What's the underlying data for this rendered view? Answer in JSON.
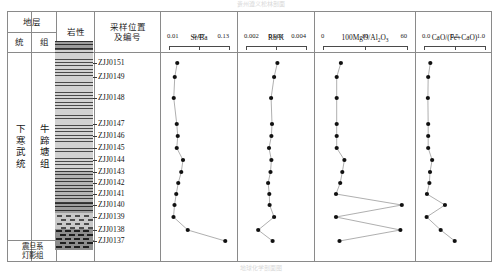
{
  "figure": {
    "top_caption_ghost": "贵州遵义松林剖面",
    "bottom_caption_ghost": "地球化学剖面图"
  },
  "table_headers": {
    "stratum": "地层",
    "stratum_sub": [
      "统",
      "组"
    ],
    "lithology": "岩性",
    "sample_position": "采样位置\n及编号",
    "sample_position_line1": "采样位置",
    "sample_position_line2": "及编号"
  },
  "stratigraphy": {
    "series_label": "下寒武统",
    "formation_label": "牛蹄塘组",
    "basal_line1": "震旦系",
    "basal_line2": "灯影组"
  },
  "samples": [
    {
      "id": "ZJJ0151",
      "y": 63
    },
    {
      "id": "ZJJ0149",
      "y": 77
    },
    {
      "id": "ZJJ0148",
      "y": 98
    },
    {
      "id": "ZJJ0147",
      "y": 124
    },
    {
      "id": "ZJJ0146",
      "y": 136
    },
    {
      "id": "ZJJ0145",
      "y": 148
    },
    {
      "id": "ZJJ0144",
      "y": 160
    },
    {
      "id": "ZJJ0143",
      "y": 172
    },
    {
      "id": "ZJJ0142",
      "y": 183
    },
    {
      "id": "ZJJ0141",
      "y": 194
    },
    {
      "id": "ZJJ0140",
      "y": 205
    },
    {
      "id": "ZJJ0139",
      "y": 217
    },
    {
      "id": "ZJJ0138",
      "y": 230
    },
    {
      "id": "ZJJ0137",
      "y": 241
    }
  ],
  "lithology_units": [
    {
      "name": "black-shale-laminated",
      "top": 0,
      "height": 8,
      "pattern": "shale-d"
    },
    {
      "name": "black-shale",
      "top": 8,
      "height": 122,
      "pattern": "shale"
    },
    {
      "name": "silty-shale",
      "top": 130,
      "height": 32,
      "pattern": "silt"
    },
    {
      "name": "dolomitic-shale",
      "top": 162,
      "height": 10,
      "pattern": "shale-d"
    },
    {
      "name": "phosphorite-dolomite",
      "top": 172,
      "height": 16,
      "pattern": "brick"
    },
    {
      "name": "dengying-dolomite",
      "top": 188,
      "height": 21,
      "pattern": "dolo"
    }
  ],
  "chart_data": [
    {
      "type": "line",
      "name": "Sr/Ba",
      "title": "Sr/Ba",
      "xlabel": "Sr/Ba",
      "ylabel": "采样位置及编号",
      "tick_labels": [
        "0.01",
        "0.07",
        "0.13"
      ],
      "tick_values": [
        0.01,
        0.07,
        0.13
      ],
      "xlim": [
        0.01,
        0.13
      ],
      "grid": false,
      "legend": "none",
      "categories": [
        "ZJJ0151",
        "ZJJ0149",
        "ZJJ0148",
        "ZJJ0147",
        "ZJJ0146",
        "ZJJ0145",
        "ZJJ0144",
        "ZJJ0143",
        "ZJJ0142",
        "ZJJ0141",
        "ZJJ0140",
        "ZJJ0139",
        "ZJJ0138",
        "ZJJ0137"
      ],
      "values": [
        0.0285,
        0.0235,
        0.0215,
        0.0275,
        0.0295,
        0.0275,
        0.04,
        0.0365,
        0.0305,
        0.0265,
        0.023,
        0.021,
        0.0495,
        0.1245
      ]
    },
    {
      "type": "line",
      "name": "Rb/K",
      "title": "Rb/K",
      "xlabel": "Rb/K",
      "ylabel": "采样位置及编号",
      "tick_labels": [
        "0.002",
        "0.003",
        "0.004"
      ],
      "tick_values": [
        0.002,
        0.003,
        0.004
      ],
      "xlim": [
        0.002,
        0.004
      ],
      "grid": false,
      "legend": "none",
      "categories": [
        "ZJJ0151",
        "ZJJ0149",
        "ZJJ0148",
        "ZJJ0147",
        "ZJJ0146",
        "ZJJ0145",
        "ZJJ0144",
        "ZJJ0143",
        "ZJJ0142",
        "ZJJ0141",
        "ZJJ0140",
        "ZJJ0139",
        "ZJJ0138",
        "ZJJ0137"
      ],
      "values": [
        0.00308,
        0.00297,
        0.00287,
        0.0029,
        0.00288,
        0.0028,
        0.00288,
        0.00285,
        0.00277,
        0.00281,
        0.00282,
        0.00297,
        0.00244,
        0.00292
      ]
    },
    {
      "type": "line",
      "name": "100MgO/Al2O3",
      "title": "100MgO/Al₂O₃",
      "xlabel": "100MgO/Al2O3",
      "ylabel": "采样位置及编号",
      "tick_labels": [
        "0",
        "30",
        "60"
      ],
      "tick_values": [
        0,
        30,
        60
      ],
      "xlim": [
        0,
        60
      ],
      "grid": false,
      "legend": "none",
      "categories": [
        "ZJJ0151",
        "ZJJ0149",
        "ZJJ0148",
        "ZJJ0147",
        "ZJJ0146",
        "ZJJ0145",
        "ZJJ0144",
        "ZJJ0143",
        "ZJJ0142",
        "ZJJ0141",
        "ZJJ0140",
        "ZJJ0139",
        "ZJJ0138",
        "ZJJ0137"
      ],
      "values": [
        13.5,
        10.5,
        10.5,
        10.5,
        10.5,
        10.5,
        16.0,
        14.5,
        13.0,
        10.0,
        57.0,
        10.0,
        56.0,
        12.5
      ]
    },
    {
      "type": "line",
      "name": "CaO/(Fe+CaO)",
      "title": "CaO/(Fe+CaO)",
      "xlabel": "CaO/(Fe+CaO)",
      "ylabel": "采样位置及编号",
      "tick_labels": [
        "0.0",
        "0.5",
        "1.0"
      ],
      "tick_values": [
        0.0,
        0.5,
        1.0
      ],
      "xlim": [
        0.0,
        1.0
      ],
      "grid": false,
      "legend": "none",
      "categories": [
        "ZJJ0151",
        "ZJJ0149",
        "ZJJ0148",
        "ZJJ0147",
        "ZJJ0146",
        "ZJJ0145",
        "ZJJ0144",
        "ZJJ0143",
        "ZJJ0142",
        "ZJJ0141",
        "ZJJ0140",
        "ZJJ0139",
        "ZJJ0138",
        "ZJJ0137"
      ],
      "values": [
        0.12,
        0.085,
        0.08,
        0.085,
        0.085,
        0.085,
        0.15,
        0.115,
        0.105,
        0.065,
        0.36,
        0.06,
        0.29,
        0.52
      ]
    }
  ],
  "colors": {
    "frame": "#8a8a8a",
    "marker": "#111111",
    "line": "#9a9a9a",
    "text": "#1a1a1a"
  }
}
